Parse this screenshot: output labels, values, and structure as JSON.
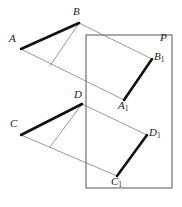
{
  "figure": {
    "canvas": {
      "width": 182,
      "height": 207,
      "background": "#ffffff"
    },
    "colors": {
      "segment_stroke": "#111111",
      "thin_stroke": "#6b6b6b",
      "plane_stroke": "#555555",
      "label_color": "#1a1a1a"
    },
    "strokes": {
      "segment_width": 2.6,
      "thin_width": 0.7,
      "plane_width": 1.0
    },
    "plane": {
      "name": "P",
      "label": "P",
      "label_x": 160,
      "label_y": 32,
      "rect": {
        "x": 86,
        "y": 35,
        "width": 86,
        "height": 153
      }
    },
    "points": [
      {
        "id": "A",
        "label": "A",
        "x": 21,
        "y": 49,
        "label_x": 9,
        "label_y": 33,
        "subscript": ""
      },
      {
        "id": "B",
        "label": "B",
        "x": 79,
        "y": 23,
        "label_x": 73,
        "label_y": 6,
        "subscript": ""
      },
      {
        "id": "A1",
        "label": "A",
        "x": 124,
        "y": 100,
        "label_x": 118,
        "label_y": 100,
        "subscript": "1"
      },
      {
        "id": "B1",
        "label": "B",
        "x": 152,
        "y": 59,
        "label_x": 154,
        "label_y": 51,
        "subscript": "1"
      },
      {
        "id": "C",
        "label": "C",
        "x": 21,
        "y": 135,
        "label_x": 10,
        "label_y": 118,
        "subscript": ""
      },
      {
        "id": "D",
        "label": "D",
        "x": 82,
        "y": 104,
        "label_x": 74,
        "label_y": 89,
        "subscript": ""
      },
      {
        "id": "C1",
        "label": "C",
        "x": 117,
        "y": 176,
        "label_x": 111,
        "label_y": 176,
        "subscript": "1"
      },
      {
        "id": "D1",
        "label": "D",
        "x": 147,
        "y": 135,
        "label_x": 149,
        "label_y": 127,
        "subscript": "1"
      }
    ],
    "thick_segments": [
      {
        "id": "seg-AB",
        "from": "A",
        "to": "B",
        "x1": 21,
        "y1": 49,
        "x2": 79,
        "y2": 23
      },
      {
        "id": "seg-A1B1",
        "from": "A1",
        "to": "B1",
        "x1": 124,
        "y1": 100,
        "x2": 152,
        "y2": 59
      },
      {
        "id": "seg-CD",
        "from": "C",
        "to": "D",
        "x1": 21,
        "y1": 135,
        "x2": 82,
        "y2": 104
      },
      {
        "id": "seg-C1D1",
        "from": "C1",
        "to": "D1",
        "x1": 117,
        "y1": 176,
        "x2": 147,
        "y2": 135
      }
    ],
    "thin_lines": [
      {
        "id": "proj-A-A1",
        "from": "A",
        "to": "A1",
        "x1": 21,
        "y1": 49,
        "x2": 124,
        "y2": 100
      },
      {
        "id": "proj-B-B1",
        "from": "B",
        "to": "B1",
        "x1": 79,
        "y1": 23,
        "x2": 152,
        "y2": 59
      },
      {
        "id": "perp-B-foot",
        "from": "B",
        "to": "foot-AB",
        "x1": 79,
        "y1": 23,
        "x2": 50,
        "y2": 66
      },
      {
        "id": "proj-C-C1",
        "from": "C",
        "to": "C1",
        "x1": 21,
        "y1": 135,
        "x2": 117,
        "y2": 176
      },
      {
        "id": "proj-D-D1",
        "from": "D",
        "to": "D1",
        "x1": 82,
        "y1": 104,
        "x2": 147,
        "y2": 135
      },
      {
        "id": "perp-D-foot",
        "from": "D",
        "to": "foot-CD",
        "x1": 82,
        "y1": 104,
        "x2": 50,
        "y2": 147
      }
    ]
  }
}
